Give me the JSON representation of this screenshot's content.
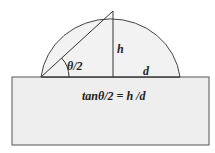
{
  "diagram": {
    "labels": {
      "angle": "θ/2",
      "height": "h",
      "base": "d",
      "formula": "tanθ/2 = h /d"
    },
    "colors": {
      "drop_fill": "#f0f0f0",
      "substrate_fill": "#eeeeee",
      "stroke": "#444444"
    }
  }
}
